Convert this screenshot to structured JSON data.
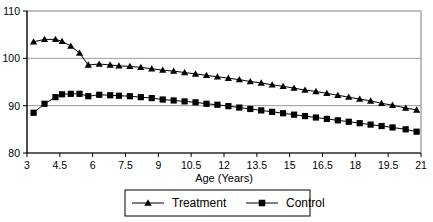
{
  "chart_data": {
    "type": "line",
    "title": "",
    "xlabel": "Age (Years)",
    "ylabel": "",
    "xlim": [
      3,
      21
    ],
    "ylim": [
      80,
      110
    ],
    "xticks": [
      "3",
      "4.5",
      "6",
      "7.5",
      "9",
      "10.5",
      "12",
      "13.5",
      "15",
      "16.5",
      "18",
      "19.5",
      "21"
    ],
    "xtick_values": [
      3,
      4.5,
      6,
      7.5,
      9,
      10.5,
      12,
      13.5,
      15,
      16.5,
      18,
      19.5,
      21
    ],
    "yticks": [
      "110",
      "100",
      "90",
      "80"
    ],
    "ytick_values": [
      110,
      100,
      90,
      80
    ],
    "grid": "horizontal-at-100-and-90",
    "legend_position": "bottom-center-boxed",
    "x": [
      3.3,
      3.8,
      4.3,
      4.6,
      5.0,
      5.4,
      5.8,
      6.3,
      6.8,
      7.2,
      7.7,
      8.2,
      8.7,
      9.2,
      9.7,
      10.2,
      10.7,
      11.2,
      11.7,
      12.2,
      12.7,
      13.2,
      13.7,
      14.2,
      14.7,
      15.2,
      15.7,
      16.2,
      16.7,
      17.2,
      17.7,
      18.2,
      18.7,
      19.2,
      19.7,
      20.3,
      20.8
    ],
    "series": [
      {
        "name": "Treatment",
        "marker": "triangle",
        "color": "#000000",
        "values": [
          103.5,
          104.0,
          104.0,
          103.6,
          102.6,
          101.1,
          98.6,
          98.8,
          98.6,
          98.4,
          98.3,
          98.1,
          97.8,
          97.5,
          97.3,
          97.0,
          96.7,
          96.4,
          96.1,
          95.8,
          95.5,
          95.1,
          94.8,
          94.4,
          94.1,
          93.7,
          93.3,
          93.0,
          92.6,
          92.2,
          91.8,
          91.4,
          91.0,
          90.5,
          90.1,
          89.5,
          89.1
        ]
      },
      {
        "name": "Control",
        "marker": "square",
        "color": "#000000",
        "values": [
          88.5,
          90.4,
          91.8,
          92.4,
          92.5,
          92.5,
          92.0,
          92.3,
          92.2,
          92.1,
          92.0,
          91.8,
          91.6,
          91.3,
          91.1,
          90.9,
          90.7,
          90.4,
          90.2,
          89.9,
          89.6,
          89.3,
          89.0,
          88.7,
          88.4,
          88.1,
          87.8,
          87.5,
          87.2,
          86.9,
          86.6,
          86.3,
          86.0,
          85.7,
          85.4,
          85.0,
          84.5
        ]
      }
    ],
    "legend": [
      {
        "label": "Treatment",
        "marker": "triangle"
      },
      {
        "label": "Control",
        "marker": "square"
      }
    ]
  }
}
